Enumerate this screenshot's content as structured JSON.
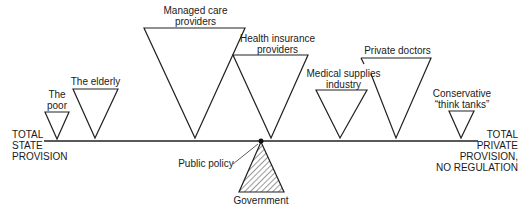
{
  "diagram": {
    "type": "seesaw-balance",
    "left_end": {
      "line1": "TOTAL",
      "line2": "STATE",
      "line3": "PROVISION"
    },
    "right_end": {
      "line1": "TOTAL",
      "line2": "PRIVATE",
      "line3": "PROVISION,",
      "line4": "NO REGULATION"
    },
    "fulcrum": {
      "label": "Government"
    },
    "pointer": {
      "label": "Public policy"
    },
    "weights": [
      {
        "line1": "The",
        "line2": "poor"
      },
      {
        "line1": "The elderly"
      },
      {
        "line1": "Managed care",
        "line2": "providers"
      },
      {
        "line1": "Health insurance",
        "line2": "providers"
      },
      {
        "line1": "Medical supplies",
        "line2": "industry"
      },
      {
        "line1": "Private doctors"
      },
      {
        "line1": "Conservative",
        "line2": "“think tanks”"
      }
    ]
  }
}
